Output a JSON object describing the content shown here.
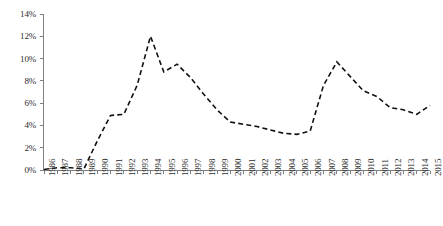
{
  "chart_data": {
    "type": "line",
    "title": "",
    "subtitle": "",
    "xlabel": "",
    "ylabel": "",
    "legend": [],
    "legend_position": "none",
    "grid": false,
    "ylim": [
      0,
      14
    ],
    "y_unit": "%",
    "y_ticks": [
      "0%",
      "2%",
      "4%",
      "6%",
      "8%",
      "10%",
      "12%",
      "14%"
    ],
    "y_tick_values": [
      0,
      2,
      4,
      6,
      8,
      10,
      12,
      14
    ],
    "x_label_rotation": -90,
    "categories": [
      "1986",
      "1987",
      "1988",
      "1989",
      "1990",
      "1991",
      "1992",
      "1993",
      "1994",
      "1995",
      "1996",
      "1997",
      "1998",
      "1999",
      "2000",
      "2001",
      "2002",
      "2003",
      "2004",
      "2005",
      "2006",
      "2007",
      "2008",
      "2009",
      "2010",
      "2011",
      "2012",
      "2013",
      "2014",
      "2015"
    ],
    "series": [
      {
        "name": "series-1",
        "style": "dashed",
        "color": "#111111",
        "values": [
          0.05,
          0.2,
          0.2,
          0.1,
          2.6,
          4.9,
          5.0,
          7.6,
          12.0,
          8.8,
          9.5,
          8.3,
          6.8,
          5.4,
          4.3,
          4.1,
          3.9,
          3.6,
          3.3,
          3.2,
          3.5,
          7.6,
          9.7,
          8.4,
          7.1,
          6.6,
          5.6,
          5.4,
          5.0,
          5.8
        ]
      }
    ],
    "axis_color": "#808080",
    "plot_box": {
      "left": 44,
      "right": 430,
      "top": 14,
      "bottom": 170
    }
  }
}
